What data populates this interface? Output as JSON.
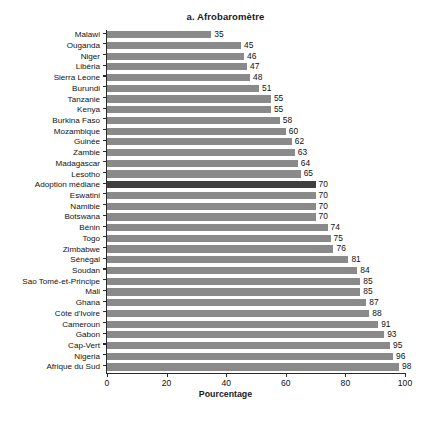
{
  "chart_data": {
    "type": "bar",
    "orientation": "horizontal",
    "title": "a. Afrobaromètre",
    "xlabel": "Pourcentage",
    "ylabel": "",
    "xlim": [
      0,
      100
    ],
    "xticks": [
      0,
      20,
      40,
      60,
      80,
      100
    ],
    "grid": false,
    "legend": null,
    "highlight_category": "Adoption médiane",
    "colors": {
      "bar": "#8a8a8a",
      "bar_highlight": "#3f3f3f",
      "axis": "#2b2b2b",
      "text": "#111111",
      "background": "#ffffff"
    },
    "categories": [
      "Malawi",
      "Ouganda",
      "Niger",
      "Libéria",
      "Sierra Leone",
      "Burundi",
      "Tanzanie",
      "Kenya",
      "Burkina Faso",
      "Mozambique",
      "Guinée",
      "Zambie",
      "Madagascar",
      "Lesotho",
      "Adoption médiane",
      "Eswatini",
      "Namibie",
      "Botswana",
      "Bénin",
      "Togo",
      "Zimbabwe",
      "Sénégal",
      "Soudan",
      "Sao Tomé-et-Principe",
      "Mali",
      "Ghana",
      "Côte d'Ivoire",
      "Cameroun",
      "Gabon",
      "Cap-Vert",
      "Nigeria",
      "Afrique du Sud"
    ],
    "values": [
      35,
      45,
      46,
      47,
      48,
      51,
      55,
      55,
      58,
      60,
      62,
      63,
      64,
      65,
      70,
      70,
      70,
      70,
      74,
      75,
      76,
      81,
      84,
      85,
      85,
      87,
      88,
      91,
      93,
      95,
      96,
      98
    ]
  }
}
